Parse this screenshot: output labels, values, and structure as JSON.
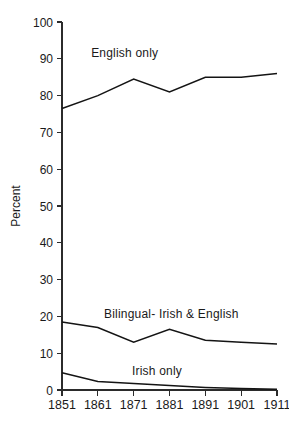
{
  "chart_data": {
    "type": "line",
    "title": "",
    "xlabel": "",
    "ylabel": "Percent",
    "x": [
      1851,
      1861,
      1871,
      1881,
      1891,
      1901,
      1911
    ],
    "xtick_labels": [
      "1851",
      "1861",
      "1871",
      "1881",
      "1891",
      "1901",
      "1911"
    ],
    "ytick_labels": [
      "0",
      "10",
      "20",
      "30",
      "40",
      "50",
      "60",
      "70",
      "80",
      "90",
      "100"
    ],
    "ytick_values": [
      0,
      10,
      20,
      30,
      40,
      50,
      60,
      70,
      80,
      90,
      100
    ],
    "ylim": [
      0,
      100
    ],
    "xlim": [
      1851,
      1911
    ],
    "grid": false,
    "legend_position": "inline-labels",
    "series": [
      {
        "name": "English only",
        "label": "English only",
        "values": [
          76.5,
          80.0,
          84.5,
          81.0,
          85.0,
          85.0,
          86.0
        ]
      },
      {
        "name": "Bilingual- Irish & English",
        "label": "Bilingual- Irish & English",
        "values": [
          18.5,
          17.0,
          13.0,
          16.5,
          13.5,
          13.0,
          12.5
        ]
      },
      {
        "name": "Irish only",
        "label": "Irish only",
        "values": [
          4.7,
          2.3,
          1.8,
          1.2,
          0.7,
          0.4,
          0.2
        ]
      }
    ],
    "annotations": [
      {
        "text": "English only",
        "x": 1868.5,
        "y": 90.5
      },
      {
        "text": "Bilingual- Irish & English",
        "x": 1881.5,
        "y": 19.5
      },
      {
        "text": "Irish only",
        "x": 1877.5,
        "y": 4.0
      }
    ]
  }
}
